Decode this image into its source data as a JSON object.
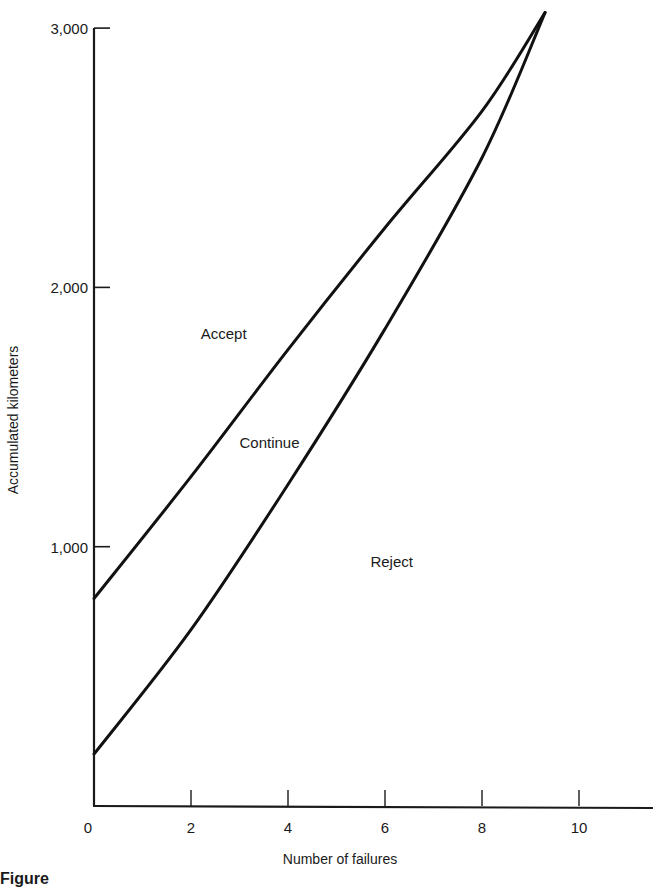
{
  "chart_data": {
    "type": "line",
    "title": "",
    "xlabel": "Number of failures",
    "ylabel": "Accumulated kilometers",
    "xlim": [
      0,
      11.3
    ],
    "ylim": [
      0,
      3000
    ],
    "grid": false,
    "legend": null,
    "x_ticks": [
      0,
      2,
      4,
      6,
      8,
      10
    ],
    "x_tick_labels": [
      "0",
      "2",
      "4",
      "6",
      "8",
      "10"
    ],
    "y_ticks": [
      1000,
      2000,
      3000
    ],
    "y_tick_labels": [
      "1,000",
      "2,000",
      "3,000"
    ],
    "series": [
      {
        "name": "Accept boundary",
        "x": [
          0,
          2,
          4,
          6,
          8,
          9.3
        ],
        "y": [
          800,
          1270,
          1760,
          2230,
          2680,
          3060
        ]
      },
      {
        "name": "Reject boundary",
        "x": [
          0,
          2,
          4,
          6,
          8,
          9.3
        ],
        "y": [
          200,
          680,
          1240,
          1840,
          2500,
          3060
        ]
      }
    ],
    "annotations": [
      {
        "text": "Accept",
        "x": 2.2,
        "y": 1800
      },
      {
        "text": "Continue",
        "x": 3.0,
        "y": 1380
      },
      {
        "text": "Reject",
        "x": 5.7,
        "y": 920
      }
    ]
  },
  "caption": "Figure"
}
